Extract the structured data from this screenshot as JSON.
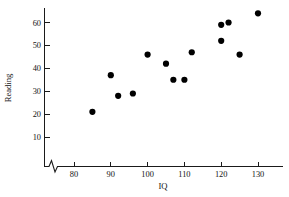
{
  "chart_data": {
    "type": "scatter",
    "title": "",
    "xlabel": "IQ",
    "ylabel": "Reading",
    "xlim": [
      72,
      134
    ],
    "ylim": [
      0,
      68
    ],
    "grid": false,
    "legend": null,
    "axis_break": {
      "axis": "x",
      "symbol": "zigzag",
      "note": "broken x-axis between origin and first tick"
    },
    "xticks": [
      80,
      90,
      100,
      110,
      120,
      130
    ],
    "xtick_labels": [
      "80",
      "90",
      "100",
      "110",
      "120",
      "130"
    ],
    "yticks": [
      10,
      20,
      30,
      40,
      50,
      60
    ],
    "ytick_labels": [
      "10",
      "20",
      "30",
      "40",
      "50",
      "60"
    ],
    "x": [
      85,
      90,
      92,
      96,
      100,
      105,
      107,
      110,
      112,
      120,
      120,
      122,
      125,
      130
    ],
    "y": [
      21,
      37,
      28,
      29,
      46,
      42,
      35,
      35,
      47,
      52,
      59,
      60,
      46,
      64
    ],
    "points": [
      {
        "x": 85,
        "y": 21
      },
      {
        "x": 90,
        "y": 37
      },
      {
        "x": 92,
        "y": 28
      },
      {
        "x": 96,
        "y": 29
      },
      {
        "x": 100,
        "y": 46
      },
      {
        "x": 105,
        "y": 42
      },
      {
        "x": 107,
        "y": 35
      },
      {
        "x": 110,
        "y": 35
      },
      {
        "x": 112,
        "y": 47
      },
      {
        "x": 120,
        "y": 52
      },
      {
        "x": 120,
        "y": 59
      },
      {
        "x": 122,
        "y": 60
      },
      {
        "x": 125,
        "y": 46
      },
      {
        "x": 130,
        "y": 64
      }
    ],
    "n_points": 14,
    "marker": "filled-circle",
    "marker_color": "#000000",
    "marker_size": 3.1,
    "axis_color": "#1a1a1a",
    "background_color": "#ffffff"
  }
}
